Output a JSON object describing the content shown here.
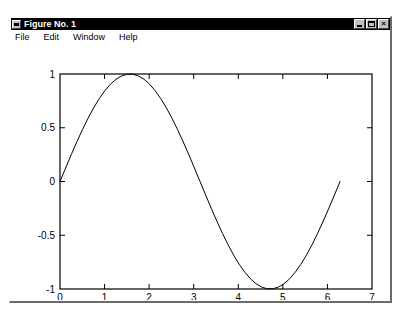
{
  "window": {
    "title": "Figure No. 1",
    "menu_icon": "window-menu-icon",
    "controls": [
      {
        "name": "minimize",
        "label": ""
      },
      {
        "name": "maximize",
        "label": ""
      },
      {
        "name": "close",
        "label": "×"
      }
    ]
  },
  "menu": {
    "items": [
      {
        "label": "File"
      },
      {
        "label": "Edit"
      },
      {
        "label": "Window"
      },
      {
        "label": "Help"
      }
    ]
  },
  "chart_data": {
    "type": "line",
    "title": "",
    "xlabel": "",
    "ylabel": "",
    "xlim": [
      0,
      7
    ],
    "ylim": [
      -1,
      1
    ],
    "grid": false,
    "legend": null,
    "box": true,
    "tick_direction": "in",
    "line_color": "#000000",
    "line_width": 1,
    "xticks": [
      0,
      1,
      2,
      3,
      4,
      5,
      6,
      7
    ],
    "xticklabels": [
      "0",
      "1",
      "2",
      "3",
      "4",
      "5",
      "6",
      "7"
    ],
    "yticks": [
      -1,
      -0.5,
      0,
      0.5,
      1
    ],
    "yticklabels": [
      "-1",
      "-0.5",
      "0",
      "0.5",
      "1"
    ],
    "series": [
      {
        "name": "sin(x)",
        "x": [
          0,
          0.1257,
          0.2513,
          0.377,
          0.5027,
          0.6283,
          0.754,
          0.8796,
          1.0053,
          1.131,
          1.2566,
          1.3823,
          1.508,
          1.6336,
          1.7593,
          1.885,
          2.0106,
          2.1363,
          2.2619,
          2.3876,
          2.5133,
          2.6389,
          2.7646,
          2.8903,
          3.0159,
          3.1416,
          3.2673,
          3.3929,
          3.5186,
          3.6442,
          3.7699,
          3.8956,
          4.0212,
          4.1469,
          4.2726,
          4.3982,
          4.5239,
          4.6496,
          4.7752,
          4.9009,
          5.0265,
          5.1522,
          5.2779,
          5.4035,
          5.5292,
          5.6549,
          5.7805,
          5.9062,
          6.0319,
          6.1575,
          6.2832
        ],
        "y": [
          0,
          0.1253,
          0.2487,
          0.3681,
          0.4818,
          0.5878,
          0.6845,
          0.7705,
          0.8443,
          0.9048,
          0.951,
          0.9823,
          0.998,
          0.998,
          0.9823,
          0.951,
          0.9048,
          0.8443,
          0.7705,
          0.6845,
          0.5878,
          0.4818,
          0.3681,
          0.2487,
          0.1253,
          0,
          -0.1253,
          -0.2487,
          -0.3681,
          -0.4818,
          -0.5878,
          -0.6845,
          -0.7705,
          -0.8443,
          -0.9048,
          -0.951,
          -0.9823,
          -0.998,
          -0.998,
          -0.9823,
          -0.951,
          -0.9048,
          -0.8443,
          -0.7705,
          -0.6845,
          -0.5878,
          -0.4818,
          -0.3681,
          -0.2487,
          -0.1253,
          0
        ]
      }
    ]
  }
}
